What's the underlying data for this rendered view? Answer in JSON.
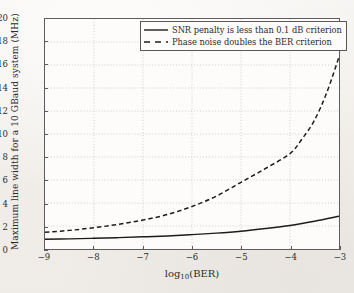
{
  "chart_data": {
    "type": "line",
    "title": "",
    "xlabel": "log10(BER)",
    "xlabel_base": "log",
    "xlabel_sub": "10",
    "xlabel_tail": "(BER)",
    "ylabel": "Maximum line width for a 10 GBaud system (MHz)",
    "xlim": [
      -9,
      -3
    ],
    "ylim": [
      0,
      20
    ],
    "xticks": [
      -9,
      -8,
      -7,
      -6,
      -5,
      -4,
      -3
    ],
    "xtick_labels": [
      "−9",
      "−8",
      "−7",
      "−6",
      "−5",
      "−4",
      "−3"
    ],
    "yticks": [
      0,
      2,
      4,
      6,
      8,
      10,
      12,
      14,
      16,
      18,
      20
    ],
    "ytick_labels": [
      "0",
      "2",
      "4",
      "6",
      "8",
      "10",
      "12",
      "14",
      "16",
      "18",
      "20"
    ],
    "grid": true,
    "grid_style": "dotted",
    "legend_position": "upper center-right",
    "series": [
      {
        "name": "SNR penalty is less than 0.1 dB criterion",
        "style": "solid",
        "color": "#1c1c1c",
        "x": [
          -9,
          -8.5,
          -8,
          -7.5,
          -7,
          -6.5,
          -6,
          -5.5,
          -5,
          -4.5,
          -4,
          -3.5,
          -3
        ],
        "values": [
          0.85,
          0.88,
          0.93,
          0.99,
          1.06,
          1.14,
          1.25,
          1.38,
          1.55,
          1.78,
          2.05,
          2.42,
          2.85
        ]
      },
      {
        "name": "Phase noise doubles the BER criterion",
        "style": "dashed",
        "color": "#1c1c1c",
        "x": [
          -9,
          -8.5,
          -8,
          -7.5,
          -7,
          -6.5,
          -6,
          -5.5,
          -5,
          -4.5,
          -4,
          -3.75,
          -3.5,
          -3.25,
          -3
        ],
        "values": [
          1.45,
          1.62,
          1.85,
          2.15,
          2.52,
          3.0,
          3.7,
          4.6,
          5.8,
          7.0,
          8.3,
          9.6,
          11.2,
          13.6,
          16.7
        ]
      }
    ]
  },
  "legend": {
    "entries": [
      {
        "label": "SNR penalty is less than 0.1 dB criterion",
        "style": "solid"
      },
      {
        "label": "Phase noise doubles the BER criterion",
        "style": "dashed"
      }
    ]
  }
}
